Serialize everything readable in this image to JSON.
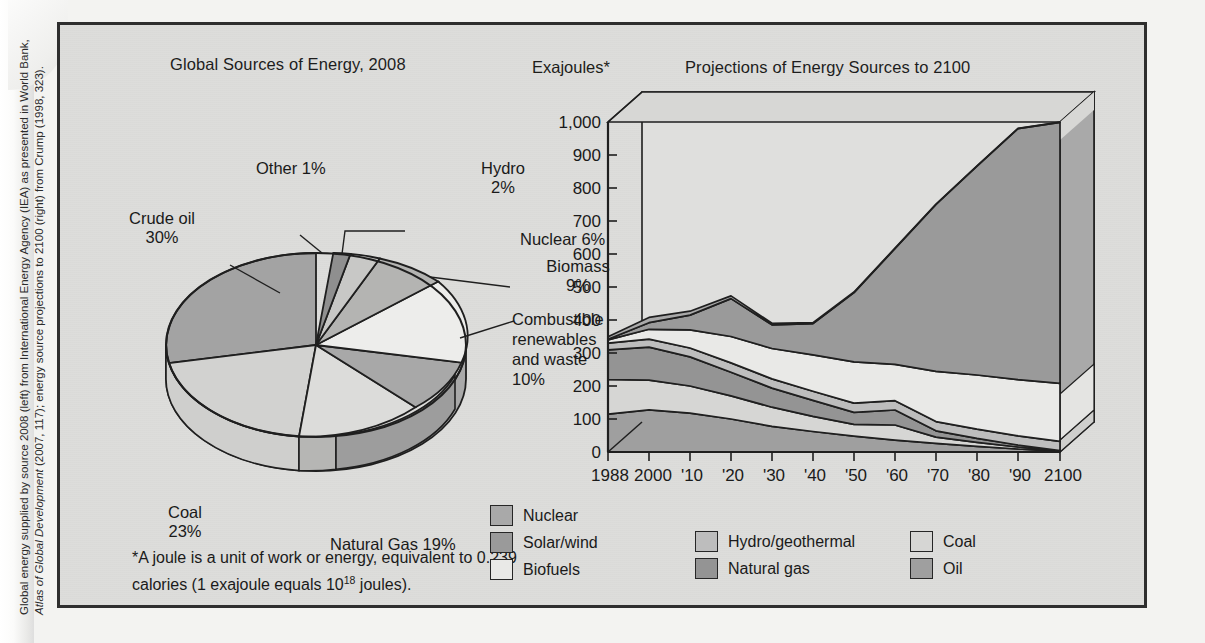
{
  "source_caption": {
    "line1": "Global energy supplied by source 2008 (left) from International Energy Agency (IEA) as presented in World Bank,",
    "line2_italic": "Atlas of Global Development",
    "line2_rest": " (2007, 117); energy source projections to 2100 (right) from Crump (1998, 323)."
  },
  "pie_panel": {
    "title": "Global Sources of Energy, 2008",
    "labels": {
      "other": "Other 1%",
      "hydro_l1": "Hydro",
      "hydro_l2": "2%",
      "nuclear": "Nuclear 6%",
      "biomass_l1": "Biomass",
      "biomass_l2": "9%",
      "combustible_l1": "Combustible",
      "combustible_l2": "renewables",
      "combustible_l3": "and waste",
      "combustible_l4": "10%",
      "crude_l1": "Crude oil",
      "crude_l2": "30%",
      "coal_l1": "Coal",
      "coal_l2": "23%",
      "gas": "Natural Gas 19%"
    }
  },
  "footnote": {
    "line1": "*A joule is a unit of work or energy, equivalent to 0.239",
    "line2_a": "calories (1 exajoule equals 10",
    "line2_sup": "18",
    "line2_b": " joules)."
  },
  "area_panel": {
    "title": "Projections of Energy Sources to 2100",
    "ylabel": "Exajoules*"
  },
  "legend": {
    "column1": [
      {
        "label": "Nuclear",
        "color": "#a9a9a9"
      },
      {
        "label": "Solar/wind",
        "color": "#9a9a9a"
      },
      {
        "label": "Biofuels",
        "color": "#e9e9e7"
      }
    ],
    "column2": [
      {
        "label": "Hydro/geothermal",
        "color": "#bdbdbd"
      },
      {
        "label": "Natural gas",
        "color": "#949494"
      }
    ],
    "column3": [
      {
        "label": "Coal",
        "color": "#d6d6d4"
      },
      {
        "label": "Oil",
        "color": "#9f9f9f"
      }
    ]
  },
  "chart_data": [
    {
      "type": "pie",
      "title": "Global Sources of Energy, 2008",
      "unit": "percent",
      "legend_position": "callout-labels",
      "slices": [
        {
          "name": "Crude oil",
          "value": 30,
          "label": "Crude oil 30%",
          "color": "#a3a3a3"
        },
        {
          "name": "Coal",
          "value": 23,
          "label": "Coal 23%",
          "color": "#d2d2d0"
        },
        {
          "name": "Natural Gas",
          "value": 19,
          "label": "Natural Gas 19%",
          "color": "#dcdcda"
        },
        {
          "name": "Combustible renewables and waste",
          "value": 10,
          "label": "Combustible renewables and waste 10%",
          "color": "#a8a8a8"
        },
        {
          "name": "Biomass",
          "value": 9,
          "label": "Biomass 9%",
          "color": "#ededeb"
        },
        {
          "name": "Nuclear",
          "value": 6,
          "label": "Nuclear 6%",
          "color": "#b4b4b2"
        },
        {
          "name": "Hydro",
          "value": 2,
          "label": "Hydro 2%",
          "color": "#c8c8c6"
        },
        {
          "name": "Other",
          "value": 1,
          "label": "Other 1%",
          "color": "#8f8f8f"
        }
      ]
    },
    {
      "type": "area",
      "title": "Projections of Energy Sources to 2100",
      "xlabel": "",
      "ylabel": "Exajoules*",
      "ylim": [
        0,
        1000
      ],
      "ytick_step": 100,
      "yticks": [
        "0",
        "100",
        "200",
        "300",
        "400",
        "500",
        "600",
        "700",
        "800",
        "900",
        "1,000"
      ],
      "grid": false,
      "stacked": true,
      "x": [
        1988,
        2000,
        2010,
        2020,
        2030,
        2040,
        2050,
        2060,
        2070,
        2080,
        2090,
        2100
      ],
      "categories": [
        "1988",
        "2000",
        "'10",
        "'20",
        "'30",
        "'40",
        "'50",
        "'60",
        "'70",
        "'80",
        "'90",
        "2100"
      ],
      "series": [
        {
          "name": "Oil",
          "color": "#9f9f9f",
          "values": [
            115,
            128,
            118,
            100,
            78,
            62,
            48,
            36,
            26,
            17,
            9,
            2
          ]
        },
        {
          "name": "Coal",
          "color": "#d6d6d4",
          "values": [
            105,
            90,
            82,
            70,
            58,
            46,
            36,
            27,
            19,
            12,
            6,
            1
          ]
        },
        {
          "name": "Natural gas",
          "color": "#949494",
          "values": [
            90,
            100,
            88,
            72,
            58,
            46,
            36,
            27,
            19,
            12,
            6,
            1
          ]
        },
        {
          "name": "Hydro/geothermal",
          "color": "#bdbdbd",
          "values": [
            20,
            24,
            27,
            28,
            28,
            28,
            28,
            28,
            28,
            28,
            28,
            28
          ]
        },
        {
          "name": "Biofuels",
          "color": "#e9e9e7",
          "values": [
            10,
            30,
            55,
            80,
            92,
            110,
            125,
            140,
            152,
            162,
            170,
            176
          ]
        },
        {
          "name": "Solar/wind",
          "color": "#9a9a9a",
          "values": [
            2,
            20,
            45,
            115,
            70,
            210,
            330,
            440,
            550,
            660,
            760,
            790
          ]
        },
        {
          "name": "Nuclear",
          "color": "#a9a9a9",
          "values": [
            8,
            16,
            12,
            8,
            5,
            3,
            2,
            1,
            1,
            1,
            1,
            1
          ]
        }
      ],
      "totals": [
        350,
        408,
        427,
        473,
        389,
        505,
        605,
        699,
        795,
        892,
        980,
        999
      ]
    }
  ]
}
